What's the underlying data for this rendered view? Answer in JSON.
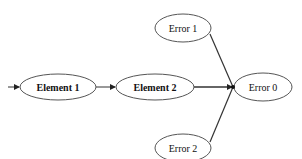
{
  "diagram": {
    "type": "flow",
    "nodes": [
      {
        "id": "element1",
        "label": "Element 1",
        "bold": true
      },
      {
        "id": "element2",
        "label": "Element 2",
        "bold": true
      },
      {
        "id": "error0",
        "label": "Error 0",
        "bold": false
      },
      {
        "id": "error1",
        "label": "Error 1",
        "bold": false
      },
      {
        "id": "error2",
        "label": "Error 2",
        "bold": false
      }
    ],
    "edges": [
      {
        "from": "start",
        "to": "element1",
        "arrow": true
      },
      {
        "from": "element1",
        "to": "element2",
        "arrow": true
      },
      {
        "from": "element2",
        "to": "error0",
        "arrow": true
      },
      {
        "from": "error1",
        "to": "error0",
        "arrow": false
      },
      {
        "from": "error2",
        "to": "error0",
        "arrow": false
      }
    ],
    "colors": {
      "stroke": "#333333",
      "fill": "#ffffff",
      "text": "#111111"
    }
  }
}
